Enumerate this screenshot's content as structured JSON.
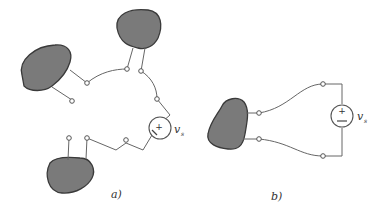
{
  "figure": {
    "panels": [
      {
        "id": "a",
        "label": "a)",
        "description": "Three networks (gray blobs) connected in series to a voltage source",
        "source": {
          "symbol": "v",
          "subscript": "s",
          "plus": "+",
          "minus": "−"
        },
        "blob_count": 3
      },
      {
        "id": "b",
        "label": "b)",
        "description": "Single network connected across a voltage source",
        "source": {
          "symbol": "v",
          "subscript": "s",
          "plus": "+",
          "minus": "−"
        },
        "blob_count": 1
      }
    ]
  },
  "colors": {
    "blob_fill": "#7a7a7a",
    "blob_stroke": "#3a3a3a",
    "wire": "#666666"
  }
}
